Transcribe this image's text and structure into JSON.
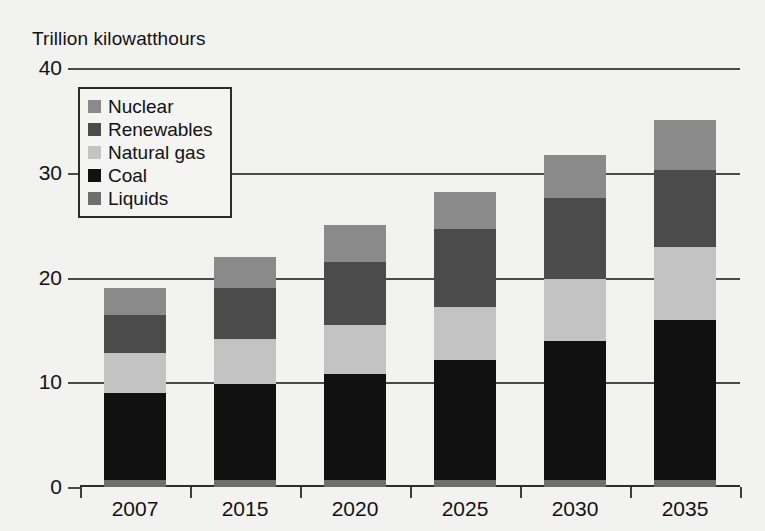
{
  "chart_data": {
    "type": "bar",
    "stacked": true,
    "title": "Trillion kilowatthours",
    "xlabel": "",
    "ylabel": "Trillion kilowatthours",
    "categories": [
      "2007",
      "2015",
      "2020",
      "2025",
      "2030",
      "2035"
    ],
    "ylim": [
      0,
      40
    ],
    "yticks": [
      0,
      10,
      20,
      30,
      40
    ],
    "ytick_labels": [
      "0",
      "10",
      "20",
      "30",
      "40"
    ],
    "grid": true,
    "legend_position": "upper-left",
    "series": [
      {
        "name": "Liquids",
        "color": "#6e6e6e",
        "values": [
          0.7,
          0.7,
          0.7,
          0.7,
          0.7,
          0.7
        ]
      },
      {
        "name": "Coal",
        "color": "#111111",
        "values": [
          8.3,
          9.1,
          10.1,
          11.4,
          13.2,
          15.2
        ]
      },
      {
        "name": "Natural gas",
        "color": "#c3c3c3",
        "values": [
          3.8,
          4.3,
          4.7,
          5.1,
          6.0,
          7.0
        ]
      },
      {
        "name": "Renewables",
        "color": "#4b4b4b",
        "values": [
          3.6,
          4.9,
          6.0,
          7.4,
          7.7,
          7.4
        ]
      },
      {
        "name": "Nuclear",
        "color": "#8a8a8a",
        "values": [
          2.6,
          3.0,
          3.5,
          3.6,
          4.1,
          4.7
        ]
      }
    ],
    "totals": [
      19.0,
      22.0,
      25.0,
      28.2,
      31.7,
      35.0
    ],
    "annotations": []
  },
  "legend": {
    "items": [
      {
        "label": "Nuclear",
        "swatch": "nuclear"
      },
      {
        "label": "Renewables",
        "swatch": "renew"
      },
      {
        "label": "Natural gas",
        "swatch": "gas"
      },
      {
        "label": "Coal",
        "swatch": "coal"
      },
      {
        "label": "Liquids",
        "swatch": "liquids"
      }
    ]
  },
  "colors": {
    "nuclear": "#8a8a8a",
    "renewables": "#4b4b4b",
    "natural_gas": "#c3c3c3",
    "coal": "#111111",
    "liquids": "#6e6e6e",
    "background": "#f2f2f0",
    "axis": "#3d3d3d"
  }
}
